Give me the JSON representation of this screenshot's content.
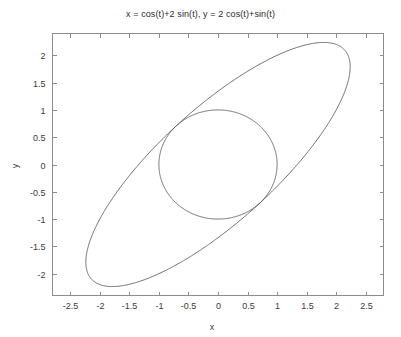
{
  "chart_data": {
    "type": "line",
    "title": "x = cos(t)+2 sin(t), y = 2 cos(t)+sin(t)",
    "xlabel": "x",
    "ylabel": "y",
    "xlim": [
      -2.8,
      2.8
    ],
    "ylim": [
      -2.4,
      2.4
    ],
    "grid": false,
    "legend": "none",
    "background": "#ffffff",
    "line_color": "#4a4a4a",
    "axis_color": "#8c8c8c",
    "text_color": "#3a3a3a",
    "xticks": [
      -2.5,
      -2,
      -1.5,
      -1,
      -0.5,
      0,
      0.5,
      1,
      1.5,
      2,
      2.5
    ],
    "xticklabels": [
      "-2.5",
      "-2",
      "-1.5",
      "-1",
      "-0.5",
      "0",
      "0.5",
      "1",
      "1.5",
      "2",
      "2.5"
    ],
    "yticks": [
      -2,
      -1.5,
      -1,
      -0.5,
      0,
      0.5,
      1,
      1.5,
      2
    ],
    "yticklabels": [
      "-2",
      "-1.5",
      "-1",
      "-0.5",
      "0",
      "0.5",
      "1",
      "1.5",
      "2"
    ],
    "series": [
      {
        "name": "ellipse",
        "parametric": true,
        "x_expr": "cos(t)+2*sin(t)",
        "y_expr": "2*cos(t)+sin(t)",
        "t_range": [
          0,
          6.283185307179586
        ],
        "semi_major": 3.0,
        "semi_minor": 1.7320508,
        "rotation_deg": 45,
        "x_extent": [
          -2.2360679,
          2.2360679
        ],
        "y_extent": [
          -2.2360679,
          2.2360679
        ]
      },
      {
        "name": "unit-circle",
        "parametric": true,
        "x_expr": "cos(t)",
        "y_expr": "sin(t)",
        "t_range": [
          0,
          6.283185307179586
        ],
        "radius": 1,
        "center": [
          0,
          0
        ],
        "x_extent": [
          -1,
          1
        ],
        "y_extent": [
          -1,
          1
        ]
      }
    ]
  }
}
